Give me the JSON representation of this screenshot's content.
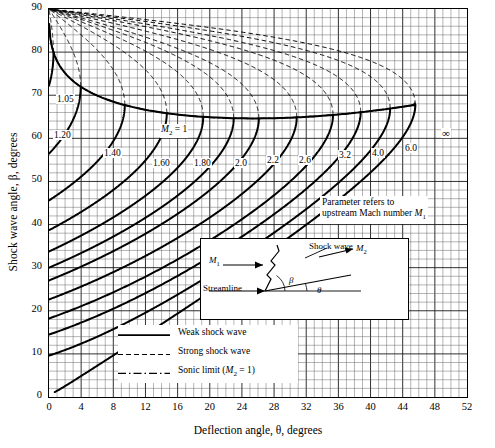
{
  "chart_data": {
    "type": "line",
    "title": "",
    "xlabel": "Deflection angle, θ, degrees",
    "ylabel": "Shock wave angle, β, degrees",
    "xlim": [
      0,
      52
    ],
    "ylim": [
      0,
      90
    ],
    "xticks": [
      "0",
      "4",
      "8",
      "12",
      "16",
      "20",
      "24",
      "28",
      "32",
      "36",
      "40",
      "44",
      "48",
      "52"
    ],
    "yticks": [
      "0",
      "10",
      "20",
      "30",
      "40",
      "50",
      "60",
      "70",
      "80",
      "90"
    ],
    "grid": true,
    "legend_position": "lower-left-inside",
    "series": [
      {
        "name": "M1 = 1.05",
        "label": "1.05",
        "mach": 1.05,
        "theta_max": 0.55,
        "beta_at_max": 73.0
      },
      {
        "name": "M1 = 1.20",
        "label": "1.20",
        "mach": 1.2,
        "theta_max": 3.4,
        "beta_at_max": 66.5
      },
      {
        "name": "M1 = 1.40",
        "label": "1.40",
        "mach": 1.4,
        "theta_max": 9.4,
        "beta_at_max": 67.0
      },
      {
        "name": "M1 = 1.60",
        "label": "1.60",
        "mach": 1.6,
        "theta_max": 14.5,
        "beta_at_max": 65.2
      },
      {
        "name": "M1 = 1.80",
        "label": "1.80",
        "mach": 1.8,
        "theta_max": 18.9,
        "beta_at_max": 64.5
      },
      {
        "name": "M1 = 2.0",
        "label": "2.0",
        "mach": 2.0,
        "theta_max": 22.9,
        "beta_at_max": 64.5
      },
      {
        "name": "M1 = 2.2",
        "label": "2.2",
        "mach": 2.2,
        "theta_max": 26.1,
        "beta_at_max": 64.6
      },
      {
        "name": "M1 = 2.6",
        "label": "2.6",
        "mach": 2.6,
        "theta_max": 31.3,
        "beta_at_max": 65.0
      },
      {
        "name": "M1 = 3.2",
        "label": "3.2",
        "mach": 3.2,
        "theta_max": 36.1,
        "beta_at_max": 65.4
      },
      {
        "name": "M1 = 4.0",
        "label": "4.0",
        "mach": 4.0,
        "theta_max": 39.0,
        "beta_at_max": 65.9
      },
      {
        "name": "M1 = 6.0",
        "label": "6.0",
        "mach": 6.0,
        "theta_max": 42.5,
        "beta_at_max": 66.5
      },
      {
        "name": "M1 = infinity",
        "label": "∞",
        "mach": 99.0,
        "theta_max": 45.5,
        "beta_at_max": 67.8
      }
    ],
    "sonic_limit_label": "M₂ = 1",
    "annotations": [
      "Parameter refers to upstream Mach number M₁"
    ]
  },
  "axes": {
    "ylabel": "Shock wave angle, β, degrees",
    "xlabel": "Deflection angle, θ, degrees",
    "yticks": [
      "0",
      "10",
      "20",
      "30",
      "40",
      "50",
      "60",
      "70",
      "80",
      "90"
    ],
    "xticks": [
      "0",
      "4",
      "8",
      "12",
      "16",
      "20",
      "24",
      "28",
      "32",
      "36",
      "40",
      "44",
      "48",
      "52"
    ]
  },
  "curve_labels": [
    {
      "text": "1.05",
      "x": 56,
      "y": 94
    },
    {
      "text": "1.20",
      "x": 53,
      "y": 130
    },
    {
      "text": "1.40",
      "x": 103,
      "y": 148
    },
    {
      "text": "1.60",
      "x": 152,
      "y": 158
    },
    {
      "text": "1.80",
      "x": 193,
      "y": 158
    },
    {
      "text": "2.0",
      "x": 234,
      "y": 158
    },
    {
      "text": "2.2",
      "x": 266,
      "y": 155
    },
    {
      "text": "2.6",
      "x": 298,
      "y": 155
    },
    {
      "text": "3.2",
      "x": 338,
      "y": 150
    },
    {
      "text": "4.0",
      "x": 371,
      "y": 148
    },
    {
      "text": "6.0",
      "x": 404,
      "y": 143
    },
    {
      "text": "∞",
      "x": 441,
      "y": 128
    }
  ],
  "sonic_label": {
    "m": "M",
    "sub": "2",
    "rest": " = 1",
    "x": 160,
    "y": 124
  },
  "param_note": {
    "line1": "Parameter refers to",
    "line2": "upstream",
    "line3": " Mach number ",
    "mach": "M",
    "sub": "1",
    "x": 320,
    "y": 196
  },
  "legend": {
    "items": [
      {
        "label": "Weak shock wave",
        "style": "solid",
        "name": "legend-weak-shock"
      },
      {
        "label": "Strong shock wave",
        "style": "dashed",
        "name": "legend-strong-shock"
      },
      {
        "label": "Sonic limit (M₂ = 1)",
        "style": "dashdot",
        "name": "legend-sonic-limit",
        "pre": "Sonic limit (",
        "m": "M",
        "sub": "2",
        "post": " = 1)"
      }
    ]
  },
  "inset": {
    "shock_wave": "Shock wave",
    "m1": "M",
    "m1_sub": "1",
    "m2": "M",
    "m2_sub": "2",
    "streamline": "Streamline",
    "beta": "β",
    "theta": "θ"
  }
}
